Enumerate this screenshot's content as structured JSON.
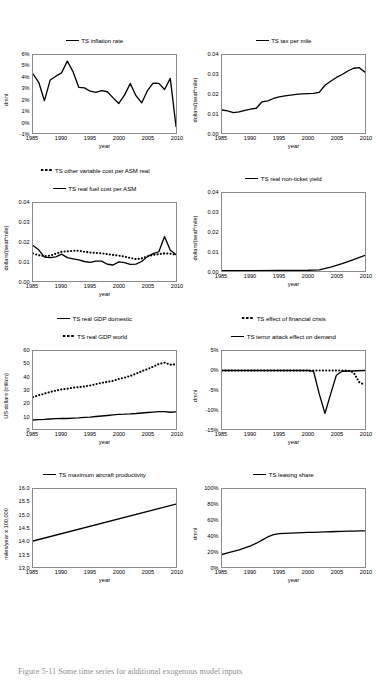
{
  "figure": {
    "caption": "Figure 5-11 Some time series for additional exogenous model inputs",
    "top_artifact": "calibration data for the aggregate model of the US airline industry"
  },
  "axis_defaults": {
    "xlabel": "year",
    "xticks": [
      "1985",
      "1990",
      "1995",
      "2000",
      "2005",
      "2010"
    ]
  },
  "chart_data": [
    {
      "id": "inflation-rate",
      "type": "line",
      "title": "TS inflation rate",
      "xlabel": "year",
      "ylabel": "dmnl",
      "xlim": [
        1985,
        2010
      ],
      "ylim": [
        -0.01,
        0.06
      ],
      "yticks": [
        "6%",
        "5%",
        "4%",
        "3%",
        "2%",
        "1%",
        "0%",
        "-1%"
      ],
      "ytick_values": [
        0.06,
        0.05,
        0.04,
        0.03,
        0.02,
        0.01,
        0.0,
        -0.01
      ],
      "xticks": [
        "1985",
        "1990",
        "1995",
        "2000",
        "2005",
        "2010"
      ],
      "grid": false,
      "legend_position": "top-center",
      "series": [
        {
          "name": "TS inflation rate",
          "style": "solid",
          "x": [
            1985,
            1986,
            1987,
            1988,
            1989,
            1990,
            1991,
            1992,
            1993,
            1994,
            1995,
            1996,
            1997,
            1998,
            1999,
            2000,
            2001,
            2002,
            2003,
            2004,
            2005,
            2006,
            2007,
            2008,
            2009,
            2010
          ],
          "values": [
            0.043,
            0.0355,
            0.019,
            0.0375,
            0.041,
            0.044,
            0.0545,
            0.045,
            0.031,
            0.0305,
            0.0275,
            0.0265,
            0.028,
            0.027,
            0.0215,
            0.0165,
            0.024,
            0.0345,
            0.0235,
            0.017,
            0.028,
            0.0348,
            0.0345,
            0.029,
            0.039,
            -0.004
          ]
        }
      ]
    },
    {
      "id": "tax-per-mile",
      "type": "line",
      "title": "TS tax per mile",
      "xlabel": "year",
      "ylabel": "dollars/(seat*mile)",
      "xlim": [
        1985,
        2010
      ],
      "ylim": [
        0.0,
        0.04
      ],
      "yticks": [
        "0.04",
        "0.03",
        "0.02",
        "0.01",
        "0.00"
      ],
      "ytick_values": [
        0.04,
        0.03,
        0.02,
        0.01,
        0.0
      ],
      "xticks": [
        "1985",
        "1990",
        "1995",
        "2000",
        "2005",
        "2010"
      ],
      "grid": false,
      "legend_position": "top-center",
      "series": [
        {
          "name": "TS tax per mile",
          "style": "solid",
          "x": [
            1985,
            1986,
            1987,
            1988,
            1989,
            1990,
            1991,
            1992,
            1993,
            1994,
            1995,
            1996,
            1997,
            1998,
            1999,
            2000,
            2001,
            2002,
            2003,
            2004,
            2005,
            2006,
            2007,
            2008,
            2009,
            2010
          ],
          "values": [
            0.0118,
            0.0113,
            0.0104,
            0.0108,
            0.0116,
            0.0122,
            0.0127,
            0.016,
            0.0165,
            0.0177,
            0.0185,
            0.019,
            0.0194,
            0.0198,
            0.0201,
            0.0202,
            0.0203,
            0.0208,
            0.0245,
            0.0265,
            0.0285,
            0.03,
            0.0318,
            0.0332,
            0.0335,
            0.0312
          ]
        }
      ]
    },
    {
      "id": "variable-and-fuel-cost",
      "type": "line",
      "title": "",
      "xlabel": "year",
      "ylabel": "dollars/(seat*mile)",
      "xlim": [
        1985,
        2010
      ],
      "ylim": [
        0.0,
        0.04
      ],
      "yticks": [
        "0.04",
        "0.03",
        "0.02",
        "0.01",
        "0.00"
      ],
      "ytick_values": [
        0.04,
        0.03,
        0.02,
        0.01,
        0.0
      ],
      "xticks": [
        "1985",
        "1990",
        "1995",
        "2000",
        "2005",
        "2010"
      ],
      "grid": false,
      "legend_position": "top-center",
      "series": [
        {
          "name": "TS other variable cost per ASM real",
          "style": "dotted",
          "x": [
            1985,
            1986,
            1987,
            1988,
            1989,
            1990,
            1991,
            1992,
            1993,
            1994,
            1995,
            1996,
            1997,
            1998,
            1999,
            2000,
            2001,
            2002,
            2003,
            2004,
            2005,
            2006,
            2007,
            2008,
            2009,
            2010
          ],
          "values": [
            0.0141,
            0.0132,
            0.0128,
            0.013,
            0.014,
            0.015,
            0.0152,
            0.0155,
            0.0155,
            0.015,
            0.0146,
            0.0144,
            0.0142,
            0.0138,
            0.0134,
            0.013,
            0.0125,
            0.0118,
            0.0112,
            0.0116,
            0.0126,
            0.0134,
            0.0138,
            0.0142,
            0.014,
            0.0134
          ]
        },
        {
          "name": "TS real fuel cost per ASM",
          "style": "solid",
          "x": [
            1985,
            1986,
            1987,
            1988,
            1989,
            1990,
            1991,
            1992,
            1993,
            1994,
            1995,
            1996,
            1997,
            1998,
            1999,
            2000,
            2001,
            2002,
            2003,
            2004,
            2005,
            2006,
            2007,
            2008,
            2009,
            2010
          ],
          "values": [
            0.0182,
            0.016,
            0.0122,
            0.012,
            0.0124,
            0.0138,
            0.012,
            0.0114,
            0.0108,
            0.01,
            0.0096,
            0.0102,
            0.0102,
            0.0086,
            0.0082,
            0.0098,
            0.0094,
            0.0085,
            0.0087,
            0.01,
            0.0125,
            0.014,
            0.015,
            0.0228,
            0.0158,
            0.0135
          ]
        }
      ]
    },
    {
      "id": "real-non-ticket-yield",
      "type": "line",
      "title": "TS real non-ticket yield",
      "xlabel": "year",
      "ylabel": "dollars/(seat*mile)",
      "xlim": [
        1985,
        2010
      ],
      "ylim": [
        0.0,
        0.04
      ],
      "yticks": [
        "0.04",
        "0.03",
        "0.02",
        "0.01",
        "0.00"
      ],
      "ytick_values": [
        0.04,
        0.03,
        0.02,
        0.01,
        0.0
      ],
      "xticks": [
        "1985",
        "1990",
        "1995",
        "2000",
        "2005",
        "2010"
      ],
      "grid": false,
      "legend_position": "top-center",
      "series": [
        {
          "name": "TS real non-ticket yield",
          "style": "solid",
          "x": [
            1985,
            1990,
            1995,
            2000,
            2002,
            2004,
            2006,
            2008,
            2010
          ],
          "values": [
            0.0002,
            0.0002,
            0.0003,
            0.0004,
            0.0006,
            0.002,
            0.0038,
            0.0058,
            0.008
          ]
        }
      ]
    },
    {
      "id": "real-gdp",
      "type": "line",
      "title": "",
      "xlabel": "year",
      "ylabel": "US dollars (trillion)",
      "xlim": [
        1985,
        2010
      ],
      "ylim": [
        0,
        60
      ],
      "yticks": [
        "60",
        "50",
        "40",
        "30",
        "20",
        "10",
        "0"
      ],
      "ytick_values": [
        60,
        50,
        40,
        30,
        20,
        10,
        0
      ],
      "xticks": [
        "1985",
        "1990",
        "1995",
        "2000",
        "2005",
        "2010"
      ],
      "grid": false,
      "legend_position": "top-center",
      "series": [
        {
          "name": "TS real GDP domestic",
          "style": "solid",
          "x": [
            1985,
            1986,
            1987,
            1988,
            1989,
            1990,
            1991,
            1992,
            1993,
            1994,
            1995,
            1996,
            1997,
            1998,
            1999,
            2000,
            2001,
            2002,
            2003,
            2004,
            2005,
            2006,
            2007,
            2008,
            2009,
            2010
          ],
          "values": [
            6.9,
            7.2,
            7.4,
            7.7,
            8.0,
            8.1,
            8.1,
            8.4,
            8.6,
            9.0,
            9.2,
            9.6,
            10.0,
            10.4,
            10.9,
            11.3,
            11.4,
            11.6,
            11.9,
            12.3,
            12.7,
            13.0,
            13.3,
            13.3,
            12.9,
            13.2
          ]
        },
        {
          "name": "TS real GDP world",
          "style": "dotted",
          "x": [
            1985,
            1986,
            1987,
            1988,
            1989,
            1990,
            1991,
            1992,
            1993,
            1994,
            1995,
            1996,
            1997,
            1998,
            1999,
            2000,
            2001,
            2002,
            2003,
            2004,
            2005,
            2006,
            2007,
            2008,
            2009,
            2010
          ],
          "values": [
            24.5,
            26.0,
            27.2,
            28.5,
            29.5,
            30.5,
            31.0,
            31.8,
            32.2,
            32.8,
            33.5,
            34.5,
            35.5,
            36.2,
            37.0,
            38.5,
            39.5,
            40.8,
            42.5,
            44.5,
            46.0,
            48.0,
            50.0,
            51.0,
            49.5,
            49.8
          ]
        }
      ]
    },
    {
      "id": "shock-effects",
      "type": "line",
      "title": "",
      "xlabel": "year",
      "ylabel": "dmnl",
      "xlim": [
        1985,
        2010
      ],
      "ylim": [
        -0.15,
        0.05
      ],
      "yticks": [
        "5%",
        "0%",
        "-5%",
        "-10%",
        "-15%"
      ],
      "ytick_values": [
        0.05,
        0.0,
        -0.05,
        -0.1,
        -0.15
      ],
      "xticks": [
        "1985",
        "1990",
        "1995",
        "2000",
        "2005",
        "2010"
      ],
      "grid": false,
      "legend_position": "top-center",
      "series": [
        {
          "name": "TS effect of financial crisis",
          "style": "dotted",
          "x": [
            1985,
            1990,
            1995,
            2000,
            2005,
            2007,
            2008,
            2009,
            2010
          ],
          "values": [
            0.0,
            0.0,
            0.0,
            0.0,
            0.0,
            0.0,
            -0.005,
            -0.03,
            -0.037
          ]
        },
        {
          "name": "TS terror attack effect on demand",
          "style": "solid",
          "x": [
            1985,
            1990,
            1995,
            2000,
            2001,
            2002,
            2003,
            2004,
            2005,
            2006,
            2010
          ],
          "values": [
            0.0,
            0.0,
            0.0,
            0.0,
            -0.002,
            -0.06,
            -0.11,
            -0.06,
            -0.012,
            -0.002,
            0.0
          ]
        }
      ]
    },
    {
      "id": "maximum-aircraft-productivity",
      "type": "line",
      "title": "TS maximum aircraft productivity",
      "xlabel": "year",
      "ylabel": "miles/year  x 100,000",
      "xlim": [
        1985,
        2010
      ],
      "ylim": [
        13.0,
        16.0
      ],
      "yticks": [
        "16.0",
        "15.5",
        "15.0",
        "14.5",
        "14.0",
        "13.5",
        "13.0"
      ],
      "ytick_values": [
        16.0,
        15.5,
        15.0,
        14.5,
        14.0,
        13.5,
        13.0
      ],
      "xticks": [
        "1985",
        "1990",
        "1995",
        "2000",
        "2005",
        "2010"
      ],
      "grid": false,
      "legend_position": "top-center",
      "series": [
        {
          "name": "TS maximum aircraft productivity",
          "style": "solid",
          "x": [
            1985,
            2010
          ],
          "values": [
            14.0,
            15.42
          ]
        }
      ]
    },
    {
      "id": "leasing-share",
      "type": "line",
      "title": "TS leasing share",
      "xlabel": "year",
      "ylabel": "dmnl",
      "xlim": [
        1985,
        2010
      ],
      "ylim": [
        0.0,
        1.0
      ],
      "yticks": [
        "100%",
        "80%",
        "60%",
        "40%",
        "20%",
        "0%"
      ],
      "ytick_values": [
        1.0,
        0.8,
        0.6,
        0.4,
        0.2,
        0.0
      ],
      "xticks": [
        "1985",
        "1990",
        "1995",
        "2000",
        "2005",
        "2010"
      ],
      "grid": false,
      "legend_position": "top-center",
      "series": [
        {
          "name": "TS leasing share",
          "style": "solid",
          "x": [
            1985,
            1986,
            1987,
            1988,
            1989,
            1990,
            1991,
            1992,
            1993,
            1994,
            1995,
            1996,
            1997,
            1998,
            1999,
            2000,
            2001,
            2002,
            2003,
            2004,
            2005,
            2006,
            2007,
            2008,
            2009,
            2010
          ],
          "values": [
            0.16,
            0.18,
            0.2,
            0.22,
            0.245,
            0.27,
            0.305,
            0.345,
            0.385,
            0.415,
            0.428,
            0.432,
            0.435,
            0.437,
            0.44,
            0.443,
            0.445,
            0.447,
            0.45,
            0.452,
            0.455,
            0.457,
            0.459,
            0.461,
            0.463,
            0.464
          ]
        }
      ]
    }
  ]
}
